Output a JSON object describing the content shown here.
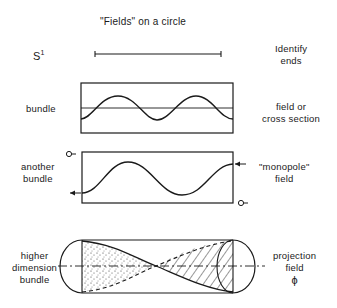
{
  "title": "\"Fields\" on a circle",
  "rows": [
    {
      "id": "s1",
      "left_label": "S",
      "left_sup": "1",
      "right_label_lines": [
        "Identify",
        "ends"
      ]
    },
    {
      "id": "bundle",
      "left_label": "bundle",
      "right_label_lines": [
        "field or",
        "cross section"
      ]
    },
    {
      "id": "another-bundle",
      "left_label_lines": [
        "another",
        "bundle"
      ],
      "right_label_lines": [
        "\"monopole\"",
        "field"
      ]
    },
    {
      "id": "higher-dimension",
      "left_label_lines": [
        "higher",
        "dimension",
        "bundle"
      ],
      "right_label_lines": [
        "projection",
        "field",
        "ϕ"
      ]
    }
  ],
  "colors": {
    "ink": "#1a1a1a",
    "background": "#ffffff"
  }
}
